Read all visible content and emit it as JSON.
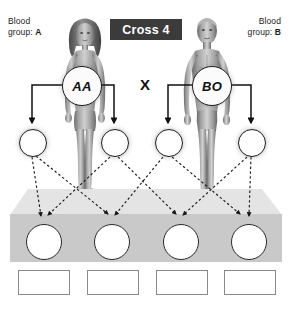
{
  "title": {
    "plaque_label": "Cross 4",
    "plaque_bg": "#3b3b3b",
    "plaque_text_color": "#ffffff"
  },
  "cross_symbol": "X",
  "parents": {
    "left": {
      "blood_group_prefix": "Blood",
      "blood_group_line2_prefix": "group: ",
      "blood_group": "A",
      "genotype": "AA",
      "sex": "female"
    },
    "right": {
      "blood_group_prefix": "Blood",
      "blood_group_line2_prefix": "group: ",
      "blood_group": "B",
      "genotype": "BO",
      "sex": "male"
    }
  },
  "gametes": [
    {
      "id": "gamete-1",
      "label": "",
      "parent": "left"
    },
    {
      "id": "gamete-2",
      "label": "",
      "parent": "left"
    },
    {
      "id": "gamete-3",
      "label": "",
      "parent": "right"
    },
    {
      "id": "gamete-4",
      "label": "",
      "parent": "right"
    }
  ],
  "offspring": [
    {
      "id": "offspring-1",
      "label": ""
    },
    {
      "id": "offspring-2",
      "label": ""
    },
    {
      "id": "offspring-3",
      "label": ""
    },
    {
      "id": "offspring-4",
      "label": ""
    }
  ],
  "answer_boxes": [
    {
      "id": "answer-1",
      "value": ""
    },
    {
      "id": "answer-2",
      "value": ""
    },
    {
      "id": "answer-3",
      "value": ""
    },
    {
      "id": "answer-4",
      "value": ""
    }
  ],
  "colors": {
    "ink": "#1d1d1d",
    "platform_top": "#e0e0e0",
    "platform_front": "#c9c9c9",
    "box_border": "#8a8a8a",
    "background": "#ffffff"
  }
}
